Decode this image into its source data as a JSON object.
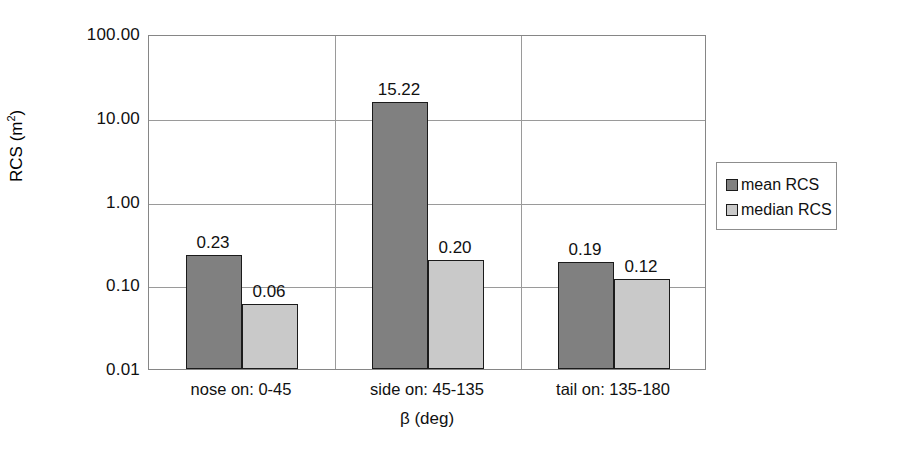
{
  "chart_data": {
    "type": "bar",
    "title": "",
    "xlabel": "β (deg)",
    "ylabel": "RCS (m²)",
    "ylabel_base": "RCS (m",
    "ylabel_exponent": "2",
    "ylabel_close": ")",
    "yscale": "log",
    "ylim": [
      0.01,
      100
    ],
    "ytick_labels": [
      "100.00",
      "10.00",
      "1.00",
      "0.10",
      "0.01"
    ],
    "ytick_values": [
      100,
      10,
      1,
      0.1,
      0.01
    ],
    "grid": "horizontal-and-category-separators",
    "legend_position": "right",
    "categories": [
      "nose on: 0-45",
      "side on: 45-135",
      "tail on: 135-180"
    ],
    "series": [
      {
        "name": "mean RCS",
        "color": "#808080",
        "values": [
          0.23,
          15.22,
          0.19
        ],
        "labels": [
          "0.23",
          "15.22",
          "0.19"
        ]
      },
      {
        "name": "median RCS",
        "color": "#c9c9c9",
        "values": [
          0.06,
          0.2,
          0.12
        ],
        "labels": [
          "0.06",
          "0.20",
          "0.12"
        ]
      }
    ]
  },
  "axes": {
    "y_ticks": [
      {
        "label": "100.00",
        "value": 100
      },
      {
        "label": "10.00",
        "value": 10
      },
      {
        "label": "1.00",
        "value": 1
      },
      {
        "label": "0.10",
        "value": 0.1
      },
      {
        "label": "0.01",
        "value": 0.01
      }
    ],
    "y_title": "RCS (m",
    "y_title_sup": "2",
    "y_title_tail": ")",
    "x_title": "β (deg)",
    "x_categories": [
      {
        "label": "nose on: 0-45"
      },
      {
        "label": "side on: 45-135"
      },
      {
        "label": "tail on: 135-180"
      }
    ]
  },
  "legend": {
    "items": [
      {
        "label": "mean RCS",
        "color": "#808080"
      },
      {
        "label": "median RCS",
        "color": "#c9c9c9"
      }
    ]
  },
  "bars": [
    {
      "group": 0,
      "series": 0,
      "label": "0.23"
    },
    {
      "group": 0,
      "series": 1,
      "label": "0.06"
    },
    {
      "group": 1,
      "series": 0,
      "label": "15.22"
    },
    {
      "group": 1,
      "series": 1,
      "label": "0.20"
    },
    {
      "group": 2,
      "series": 0,
      "label": "0.19"
    },
    {
      "group": 2,
      "series": 1,
      "label": "0.12"
    }
  ]
}
